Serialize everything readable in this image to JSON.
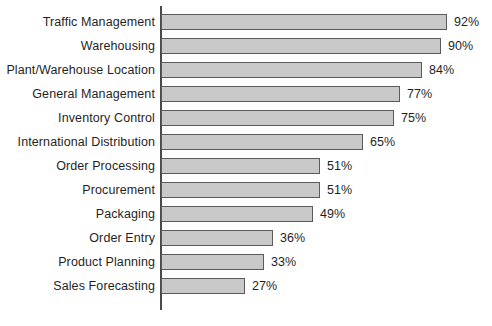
{
  "chart_data": {
    "type": "bar",
    "orientation": "horizontal",
    "title": "",
    "xlabel": "",
    "ylabel": "",
    "xlim": [
      0,
      92
    ],
    "grid": false,
    "legend": null,
    "value_suffix": "%",
    "categories": [
      "Traffic Management",
      "Warehousing",
      "Plant/Warehouse Location",
      "General Management",
      "Inventory Control",
      "International Distribution",
      "Order Processing",
      "Procurement",
      "Packaging",
      "Order Entry",
      "Product Planning",
      "Sales Forecasting"
    ],
    "values": [
      92,
      90,
      84,
      77,
      75,
      65,
      51,
      51,
      49,
      36,
      33,
      27
    ],
    "value_labels": [
      "92%",
      "90%",
      "84%",
      "77%",
      "75%",
      "65%",
      "51%",
      "51%",
      "49%",
      "36%",
      "33%",
      "27%"
    ],
    "colors": {
      "bar_fill": "#c9c9c9",
      "bar_border": "#5a5a5a",
      "axis": "#4a4a4a",
      "text": "#1f1f1f",
      "background": "#ffffff"
    },
    "scale": {
      "axis_x_px": 161,
      "px_per_percent": 3.11
    }
  }
}
